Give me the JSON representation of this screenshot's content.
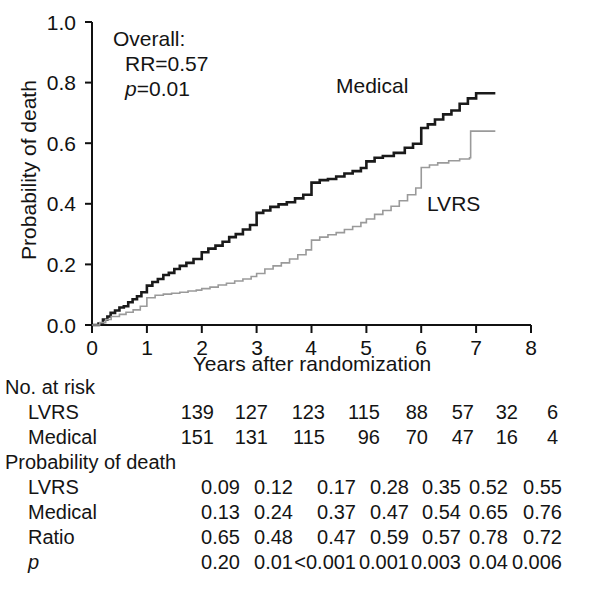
{
  "chart_data": {
    "type": "line",
    "title": "",
    "xlabel": "Years after randomization",
    "ylabel": "Probability of death",
    "xlim": [
      0,
      8
    ],
    "ylim": [
      0,
      1.0
    ],
    "xticks": [
      "0",
      "1",
      "2",
      "3",
      "4",
      "5",
      "6",
      "7",
      "8"
    ],
    "yticks": [
      "0.0",
      "0.2",
      "0.4",
      "0.6",
      "0.8",
      "1.0"
    ],
    "grid": false,
    "legend_position": "inline-labels",
    "annotations": {
      "overall_label": "Overall:",
      "rr_label": "RR=0.57",
      "p_label_italic": "p",
      "p_label_rest": "=0.01"
    },
    "series": [
      {
        "name": "Medical",
        "color": "#1a1a1a",
        "linewidth": 2.6,
        "inline_label": "Medical",
        "step_points": [
          [
            0.0,
            0.0
          ],
          [
            0.12,
            0.005
          ],
          [
            0.2,
            0.018
          ],
          [
            0.28,
            0.028
          ],
          [
            0.34,
            0.04
          ],
          [
            0.42,
            0.048
          ],
          [
            0.5,
            0.058
          ],
          [
            0.58,
            0.062
          ],
          [
            0.66,
            0.075
          ],
          [
            0.74,
            0.085
          ],
          [
            0.82,
            0.095
          ],
          [
            0.9,
            0.108
          ],
          [
            1.0,
            0.13
          ],
          [
            1.1,
            0.142
          ],
          [
            1.2,
            0.152
          ],
          [
            1.3,
            0.165
          ],
          [
            1.4,
            0.172
          ],
          [
            1.5,
            0.185
          ],
          [
            1.6,
            0.195
          ],
          [
            1.72,
            0.205
          ],
          [
            1.85,
            0.218
          ],
          [
            2.0,
            0.24
          ],
          [
            2.12,
            0.252
          ],
          [
            2.25,
            0.262
          ],
          [
            2.38,
            0.275
          ],
          [
            2.5,
            0.29
          ],
          [
            2.62,
            0.3
          ],
          [
            2.75,
            0.315
          ],
          [
            2.88,
            0.33
          ],
          [
            3.0,
            0.37
          ],
          [
            3.12,
            0.378
          ],
          [
            3.25,
            0.39
          ],
          [
            3.4,
            0.398
          ],
          [
            3.55,
            0.405
          ],
          [
            3.7,
            0.418
          ],
          [
            3.85,
            0.43
          ],
          [
            4.0,
            0.47
          ],
          [
            4.15,
            0.478
          ],
          [
            4.3,
            0.482
          ],
          [
            4.45,
            0.49
          ],
          [
            4.6,
            0.5
          ],
          [
            4.75,
            0.508
          ],
          [
            4.9,
            0.518
          ],
          [
            5.0,
            0.54
          ],
          [
            5.15,
            0.552
          ],
          [
            5.3,
            0.558
          ],
          [
            5.5,
            0.568
          ],
          [
            5.7,
            0.585
          ],
          [
            5.85,
            0.598
          ],
          [
            6.0,
            0.65
          ],
          [
            6.12,
            0.662
          ],
          [
            6.25,
            0.678
          ],
          [
            6.4,
            0.695
          ],
          [
            6.55,
            0.708
          ],
          [
            6.7,
            0.73
          ],
          [
            6.85,
            0.748
          ],
          [
            7.0,
            0.765
          ],
          [
            7.35,
            0.765
          ]
        ]
      },
      {
        "name": "LVRS",
        "color": "#9a9a9a",
        "linewidth": 1.6,
        "inline_label": "LVRS",
        "step_points": [
          [
            0.0,
            0.0
          ],
          [
            0.14,
            0.008
          ],
          [
            0.25,
            0.018
          ],
          [
            0.35,
            0.028
          ],
          [
            0.5,
            0.035
          ],
          [
            0.62,
            0.042
          ],
          [
            0.75,
            0.05
          ],
          [
            0.88,
            0.062
          ],
          [
            1.0,
            0.09
          ],
          [
            1.15,
            0.098
          ],
          [
            1.3,
            0.102
          ],
          [
            1.45,
            0.105
          ],
          [
            1.6,
            0.108
          ],
          [
            1.75,
            0.112
          ],
          [
            1.9,
            0.115
          ],
          [
            2.0,
            0.12
          ],
          [
            2.15,
            0.125
          ],
          [
            2.3,
            0.132
          ],
          [
            2.45,
            0.138
          ],
          [
            2.6,
            0.145
          ],
          [
            2.75,
            0.152
          ],
          [
            2.9,
            0.16
          ],
          [
            3.0,
            0.17
          ],
          [
            3.15,
            0.185
          ],
          [
            3.3,
            0.195
          ],
          [
            3.45,
            0.205
          ],
          [
            3.6,
            0.218
          ],
          [
            3.75,
            0.232
          ],
          [
            3.9,
            0.248
          ],
          [
            4.0,
            0.28
          ],
          [
            4.15,
            0.29
          ],
          [
            4.3,
            0.298
          ],
          [
            4.45,
            0.305
          ],
          [
            4.6,
            0.315
          ],
          [
            4.75,
            0.325
          ],
          [
            4.9,
            0.338
          ],
          [
            5.0,
            0.35
          ],
          [
            5.15,
            0.365
          ],
          [
            5.3,
            0.378
          ],
          [
            5.45,
            0.392
          ],
          [
            5.6,
            0.41
          ],
          [
            5.75,
            0.43
          ],
          [
            5.9,
            0.452
          ],
          [
            6.0,
            0.52
          ],
          [
            6.15,
            0.528
          ],
          [
            6.3,
            0.535
          ],
          [
            6.5,
            0.542
          ],
          [
            6.7,
            0.548
          ],
          [
            6.88,
            0.552
          ],
          [
            6.9,
            0.64
          ],
          [
            7.35,
            0.64
          ]
        ]
      }
    ]
  },
  "table": {
    "sections": [
      {
        "heading": "No. at risk",
        "rows": [
          {
            "label": "LVRS",
            "values": [
              "139",
              "127",
              "123",
              "115",
              "88",
              "57",
              "32",
              "6"
            ]
          },
          {
            "label": "Medical",
            "values": [
              "151",
              "131",
              "115",
              "96",
              "70",
              "47",
              "16",
              "4"
            ]
          }
        ]
      },
      {
        "heading": "Probability of death",
        "rows": [
          {
            "label": "LVRS",
            "values": [
              "0.09",
              "0.12",
              "0.17",
              "0.28",
              "0.35",
              "0.52",
              "0.55"
            ]
          },
          {
            "label": "Medical",
            "values": [
              "0.13",
              "0.24",
              "0.37",
              "0.47",
              "0.54",
              "0.65",
              "0.76"
            ]
          },
          {
            "label": "Ratio",
            "values": [
              "0.65",
              "0.48",
              "0.47",
              "0.59",
              "0.57",
              "0.78",
              "0.72"
            ]
          },
          {
            "label": "p",
            "label_italic": true,
            "values": [
              "0.20",
              "0.01",
              "<0.001",
              "0.001",
              "0.003",
              "0.04",
              "0.006"
            ]
          }
        ]
      }
    ]
  }
}
